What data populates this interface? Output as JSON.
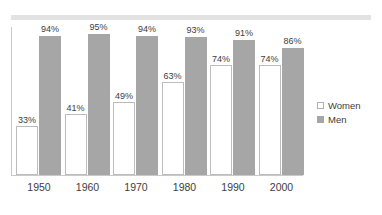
{
  "chart_data": {
    "type": "bar",
    "title": "",
    "subtitle": "",
    "xlabel": "",
    "ylabel": "",
    "ylim": [
      0,
      100
    ],
    "grid": false,
    "legend_position": "right",
    "categories": [
      "1950",
      "1960",
      "1970",
      "1980",
      "1990",
      "2000"
    ],
    "series": [
      {
        "name": "Women",
        "color": "#ffffff",
        "values": [
          33,
          41,
          49,
          63,
          74,
          74
        ],
        "labels": [
          "33%",
          "41%",
          "49%",
          "63%",
          "74%",
          "74%"
        ]
      },
      {
        "name": "Men",
        "color": "#a6a6a6",
        "values": [
          94,
          95,
          94,
          93,
          91,
          86
        ],
        "labels": [
          "94%",
          "95%",
          "94%",
          "93%",
          "91%",
          "86%"
        ]
      }
    ]
  },
  "legend": {
    "items": [
      {
        "label": "Women",
        "swatch": "women-swatch-icon"
      },
      {
        "label": "Men",
        "swatch": "men-swatch-icon"
      }
    ]
  },
  "axis": {
    "x_ticks": [
      "1950",
      "1960",
      "1970",
      "1980",
      "1990",
      "2000"
    ]
  },
  "colors": {
    "men_bar": "#a6a6a6",
    "women_bar": "#ffffff",
    "women_bar_border": "#bcbcbc",
    "axis_line": "#c9c9c9",
    "top_band": "#e2e2e2",
    "text": "#3d3d3d",
    "background": "#ffffff"
  }
}
